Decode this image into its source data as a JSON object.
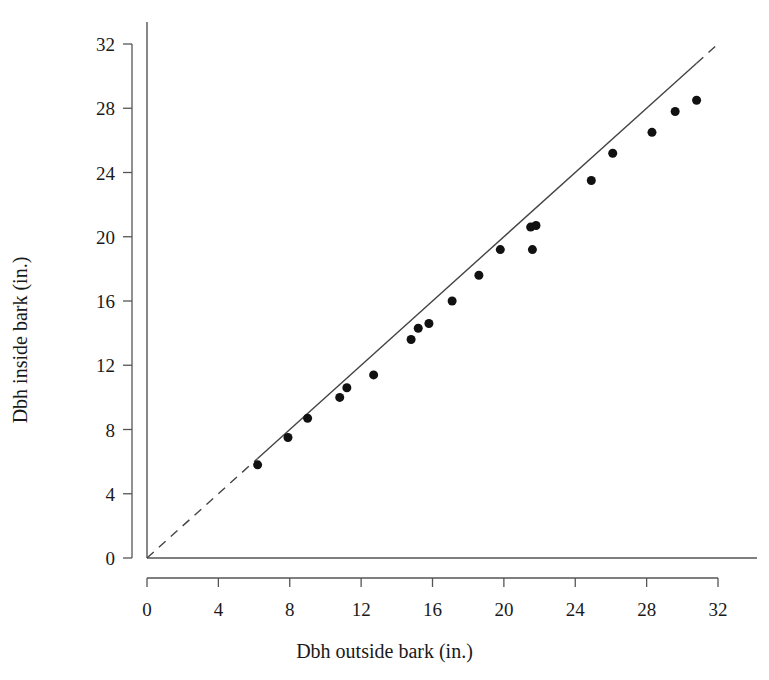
{
  "chart_data": {
    "type": "scatter",
    "title": "",
    "subtitle": "",
    "xlabel": "Dbh outside bark (in.)",
    "ylabel": "Dbh inside bark (in.)",
    "xlim": [
      0,
      32
    ],
    "ylim": [
      0,
      32
    ],
    "xticks": [
      0,
      4,
      8,
      12,
      16,
      20,
      24,
      28,
      32
    ],
    "yticks": [
      0,
      4,
      8,
      12,
      16,
      20,
      24,
      28,
      32
    ],
    "xtick_labels": [
      "0",
      "4",
      "8",
      "12",
      "16",
      "20",
      "24",
      "28",
      "32"
    ],
    "ytick_labels": [
      "0",
      "4",
      "8",
      "12",
      "16",
      "20",
      "24",
      "28",
      "32"
    ],
    "grid": false,
    "legend": false,
    "legend_position": "none",
    "marker": "filled-circle",
    "marker_color": "#111111",
    "marker_size_px": 9,
    "axis_color": "#555555",
    "series": [
      {
        "name": "Dbh inside vs outside bark",
        "points": [
          {
            "x": 6.2,
            "y": 5.8
          },
          {
            "x": 7.9,
            "y": 7.5
          },
          {
            "x": 9.0,
            "y": 8.7
          },
          {
            "x": 10.8,
            "y": 10.0
          },
          {
            "x": 11.2,
            "y": 10.6
          },
          {
            "x": 12.7,
            "y": 11.4
          },
          {
            "x": 14.8,
            "y": 13.6
          },
          {
            "x": 15.2,
            "y": 14.3
          },
          {
            "x": 15.8,
            "y": 14.6
          },
          {
            "x": 17.1,
            "y": 16.0
          },
          {
            "x": 18.6,
            "y": 17.6
          },
          {
            "x": 19.8,
            "y": 19.2
          },
          {
            "x": 21.5,
            "y": 20.6
          },
          {
            "x": 21.8,
            "y": 20.7
          },
          {
            "x": 21.6,
            "y": 19.2
          },
          {
            "x": 24.9,
            "y": 23.5
          },
          {
            "x": 26.1,
            "y": 25.2
          },
          {
            "x": 28.3,
            "y": 26.5
          },
          {
            "x": 29.6,
            "y": 27.8
          },
          {
            "x": 30.8,
            "y": 28.5
          }
        ]
      }
    ],
    "reference_line": {
      "name": "one-to-one line",
      "slope": 1,
      "intercept": 0,
      "solid_range": [
        6.2,
        30.8
      ],
      "dashed_ranges": [
        [
          0,
          6.2
        ],
        [
          30.8,
          32.5
        ]
      ],
      "color": "#444444"
    },
    "annotations": []
  },
  "axes": {
    "x_title": "Dbh outside bark (in.)",
    "y_title": "Dbh inside bark (in.)"
  }
}
